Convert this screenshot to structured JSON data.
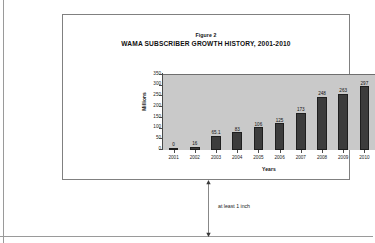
{
  "page": {
    "background_color": "#ffffff",
    "guide_line_color": "#9a9a9a"
  },
  "figure": {
    "caption": "Figure 2",
    "title": "WAMA SUBSCRIBER GROWTH HISTORY, 2001-2010",
    "border_color": "#808080"
  },
  "annotation": {
    "spacing_note": "at least 1 inch",
    "arrow_name": "vertical-double-headed-arrow"
  },
  "chart_data": {
    "type": "bar",
    "title": "WAMA SUBSCRIBER GROWTH HISTORY, 2001-2010",
    "subtitle": "Figure 2",
    "xlabel": "Years",
    "ylabel": "Millions",
    "categories": [
      "2001",
      "2002",
      "2003",
      "2004",
      "2005",
      "2006",
      "2007",
      "2008",
      "2009",
      "2010"
    ],
    "values": [
      0,
      16,
      65.1,
      83,
      106,
      125,
      173,
      248,
      263,
      297
    ],
    "value_labels": [
      "0",
      "16",
      "65.1",
      "83",
      "106",
      "125",
      "173",
      "248",
      "263",
      "297"
    ],
    "ylim": [
      0,
      350
    ],
    "yticks": [
      0,
      50,
      100,
      150,
      200,
      250,
      300,
      350
    ],
    "ytick_labels": [
      "0",
      "50",
      "100",
      "150",
      "200",
      "250",
      "300",
      "350"
    ],
    "grid": false,
    "legend": false,
    "plot_background_color": "#c9c9c9",
    "bar_color": "#3c3c3c",
    "bar_edge_color": "#1e1e1e",
    "axis_color": "#4a4a4a"
  }
}
